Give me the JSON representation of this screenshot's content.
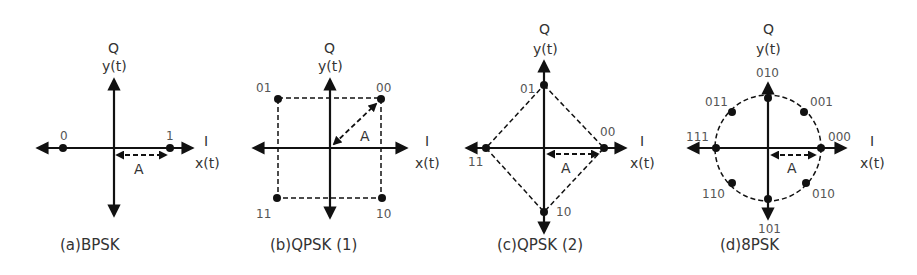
{
  "figure": {
    "panels": [
      {
        "id": "a",
        "caption": "(a)BPSK",
        "axis_q": "Q",
        "axis_y": "y(t)",
        "axis_i": "I",
        "axis_x": "x(t)",
        "amplitude_label": "A",
        "points": [
          {
            "label": "0",
            "phase_deg": 180
          },
          {
            "label": "1",
            "phase_deg": 0
          }
        ]
      },
      {
        "id": "b",
        "caption": "(b)QPSK (1)",
        "axis_q": "Q",
        "axis_y": "y(t)",
        "axis_i": "I",
        "axis_x": "x(t)",
        "amplitude_label": "A",
        "points": [
          {
            "label": "00",
            "phase_deg": 45
          },
          {
            "label": "01",
            "phase_deg": 135
          },
          {
            "label": "11",
            "phase_deg": 225
          },
          {
            "label": "10",
            "phase_deg": 315
          }
        ]
      },
      {
        "id": "c",
        "caption": "(c)QPSK (2)",
        "axis_q": "Q",
        "axis_y": "y(t)",
        "axis_i": "I",
        "axis_x": "x(t)",
        "amplitude_label": "A",
        "points": [
          {
            "label": "00",
            "phase_deg": 0
          },
          {
            "label": "01",
            "phase_deg": 90
          },
          {
            "label": "11",
            "phase_deg": 180
          },
          {
            "label": "10",
            "phase_deg": 270
          }
        ]
      },
      {
        "id": "d",
        "caption": "(d)8PSK",
        "axis_q": "Q",
        "axis_y": "y(t)",
        "axis_i": "I",
        "axis_x": "x(t)",
        "amplitude_label": "A",
        "points": [
          {
            "label": "000",
            "phase_deg": 0
          },
          {
            "label": "001",
            "phase_deg": 45
          },
          {
            "label": "010",
            "phase_deg": 90
          },
          {
            "label": "011",
            "phase_deg": 135
          },
          {
            "label": "111",
            "phase_deg": 180
          },
          {
            "label": "110",
            "phase_deg": 225
          },
          {
            "label": "101",
            "phase_deg": 270
          },
          {
            "label": "010",
            "phase_deg": 315
          }
        ]
      }
    ]
  }
}
